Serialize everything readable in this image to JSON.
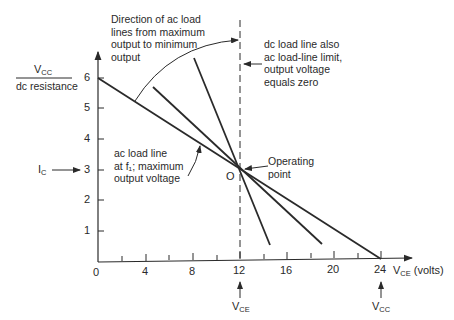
{
  "diagram": {
    "type": "transistor load-line diagram",
    "x_axis": {
      "label": "V",
      "label_sub": "CE",
      "label_unit": "(volts)",
      "ticks": [
        "0",
        "4",
        "8",
        "12",
        "16",
        "20",
        "24"
      ],
      "range": [
        0,
        24
      ]
    },
    "y_axis": {
      "ticks": [
        "1",
        "2",
        "3",
        "4",
        "5",
        "6"
      ],
      "range": [
        0,
        6
      ]
    },
    "y_labels": {
      "vcc_over_r_numerator": "V",
      "vcc_over_r_numerator_sub": "CC",
      "vcc_over_r_denominator": "dc resistance",
      "ic": "I",
      "ic_sub": "C"
    },
    "x_markers": {
      "vce": "V",
      "vce_sub": "CE",
      "vcc": "V",
      "vcc_sub": "CC"
    },
    "annotations": {
      "direction": [
        "Direction of ac load",
        "lines from maximum",
        "output to minimum",
        "output"
      ],
      "dc_limit": [
        "dc load line also",
        "ac load-line limit,",
        "output voltage",
        "equals zero"
      ],
      "ac_max": [
        "ac load line",
        "at f₁; maximum",
        "output voltage"
      ],
      "operating_point": [
        "Operating",
        "point"
      ],
      "o_label": "O"
    },
    "lines": [
      {
        "name": "dc load line / ac max output",
        "from": [
          0,
          6
        ],
        "to": [
          24,
          0
        ]
      },
      {
        "name": "ac load line intermediate",
        "from": [
          4.7,
          5.7
        ],
        "to": [
          19,
          0.6
        ]
      },
      {
        "name": "ac load line steep",
        "from": [
          8.2,
          6.6
        ],
        "to": [
          14.6,
          0.6
        ]
      },
      {
        "name": "ac load-line limit (vertical, dashed)",
        "x": 12
      }
    ],
    "operating_point": {
      "vce": 12,
      "ic": 3
    }
  }
}
